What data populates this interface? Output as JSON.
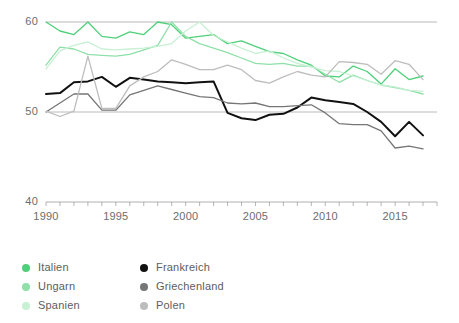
{
  "chart_data": {
    "type": "line",
    "title": "",
    "subtitle": "",
    "xlabel": "",
    "ylabel": "",
    "xlim": [
      1990,
      2017
    ],
    "ylim": [
      40,
      60
    ],
    "yticks": [
      40,
      50,
      60
    ],
    "ytick_labels": [
      "40",
      "50",
      "60"
    ],
    "xticks": [
      1990,
      1995,
      2000,
      2005,
      2010,
      2015
    ],
    "xtick_labels": [
      "1990",
      "1995",
      "2000",
      "2005",
      "2010",
      "2015"
    ],
    "x_minor_tick_step": 1,
    "grid": "horizontal",
    "legend_position": "bottom-left",
    "x": [
      1990,
      1991,
      1992,
      1993,
      1994,
      1995,
      1996,
      1997,
      1998,
      1999,
      2000,
      2001,
      2002,
      2003,
      2004,
      2005,
      2006,
      2007,
      2008,
      2009,
      2010,
      2011,
      2012,
      2013,
      2014,
      2015,
      2016,
      2017
    ],
    "series": [
      {
        "name": "Italien",
        "color": "#4ed07a",
        "values": [
          60.0,
          59.0,
          58.6,
          60.0,
          58.4,
          58.2,
          58.9,
          58.6,
          60.0,
          59.7,
          58.2,
          58.4,
          58.6,
          57.6,
          57.9,
          57.3,
          56.7,
          56.5,
          55.8,
          55.2,
          54.0,
          53.9,
          55.1,
          54.5,
          53.1,
          54.8,
          53.6,
          54.0
        ]
      },
      {
        "name": "Ungarn",
        "color": "#8fe0a8",
        "values": [
          55.2,
          57.2,
          57.0,
          56.4,
          56.3,
          56.2,
          56.4,
          56.9,
          57.4,
          60.0,
          58.4,
          57.6,
          57.1,
          56.6,
          56.0,
          55.4,
          55.3,
          55.4,
          55.1,
          55.1,
          54.2,
          53.3,
          54.1,
          53.5,
          53.0,
          52.7,
          52.4,
          52.0
        ]
      },
      {
        "name": "Spanien",
        "color": "#c7f0d4",
        "values": [
          54.8,
          56.8,
          57.4,
          57.8,
          57.0,
          56.9,
          57.0,
          57.1,
          57.3,
          57.6,
          59.0,
          60.0,
          58.5,
          57.8,
          57.1,
          56.5,
          56.8,
          56.0,
          55.4,
          55.0,
          54.6,
          54.5,
          54.0,
          53.5,
          53.0,
          52.8,
          52.4,
          52.3
        ]
      },
      {
        "name": "Frankreich",
        "color": "#111111",
        "values": [
          52.0,
          52.1,
          53.3,
          53.4,
          53.9,
          52.8,
          53.8,
          53.6,
          53.4,
          53.3,
          53.2,
          53.3,
          53.4,
          49.9,
          49.3,
          49.1,
          49.7,
          49.8,
          50.5,
          51.6,
          51.3,
          51.1,
          50.9,
          50.0,
          48.9,
          47.3,
          48.9,
          47.4
        ]
      },
      {
        "name": "Griechenland",
        "color": "#767676",
        "values": [
          50.0,
          51.0,
          52.0,
          52.0,
          50.2,
          50.2,
          51.9,
          52.4,
          52.9,
          52.5,
          52.1,
          51.7,
          51.6,
          51.0,
          50.9,
          51.0,
          50.6,
          50.6,
          50.7,
          50.8,
          49.9,
          48.7,
          48.6,
          48.6,
          47.9,
          46.0,
          46.2,
          45.9
        ]
      },
      {
        "name": "Polen",
        "color": "#bdbdbd",
        "values": [
          50.1,
          49.5,
          50.1,
          56.2,
          50.4,
          50.4,
          52.9,
          53.9,
          54.5,
          55.8,
          55.3,
          54.7,
          54.7,
          55.2,
          54.7,
          53.5,
          53.2,
          53.9,
          54.5,
          54.1,
          53.9,
          55.6,
          55.5,
          55.3,
          54.2,
          55.7,
          55.3,
          53.6
        ]
      }
    ]
  },
  "legend": {
    "items": [
      {
        "label": "Italien",
        "color": "#4ed07a"
      },
      {
        "label": "Ungarn",
        "color": "#8fe0a8"
      },
      {
        "label": "Spanien",
        "color": "#c7f0d4"
      },
      {
        "label": "Frankreich",
        "color": "#111111"
      },
      {
        "label": "Griechenland",
        "color": "#767676"
      },
      {
        "label": "Polen",
        "color": "#bdbdbd"
      }
    ]
  },
  "axis": {
    "y_labels": [
      "60",
      "50",
      "40"
    ],
    "x_labels": [
      "1990",
      "1995",
      "2000",
      "2005",
      "2010",
      "2015"
    ]
  },
  "colors": {
    "gridline": "#9a9a9a",
    "axis_text": "#6d6d6d",
    "legend_text": "#5d5d5d",
    "background": "#ffffff"
  }
}
